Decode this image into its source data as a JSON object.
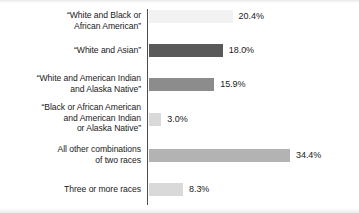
{
  "chart_data": {
    "type": "bar",
    "orientation": "horizontal",
    "title": "",
    "subtitle": "",
    "xlabel": "",
    "ylabel": "",
    "grid": false,
    "legend": null,
    "axis": {
      "value_axis_range": [
        0,
        40
      ],
      "value_axis_unit": "percent",
      "value_axis_ticks_shown": false,
      "category_axis_line": true
    },
    "categories": [
      "“White and Black or\nAfrican American”",
      "“White and Asian”",
      "“White and American Indian\nand Alaska Native”",
      "“Black or African American\nand American Indian\nor Alaska Native”",
      "All other combinations\nof two races",
      "Three or more races"
    ],
    "values": [
      20.4,
      18.0,
      15.9,
      3.0,
      34.4,
      8.3
    ],
    "value_labels": [
      "20.4%",
      "18.0%",
      "15.9%",
      "3.0%",
      "34.4%",
      "8.3%"
    ],
    "bar_colors": [
      "#f2f2f2",
      "#595959",
      "#8c8c8c",
      "#d9d9d9",
      "#b3b3b3",
      "#d9d9d9"
    ],
    "axis_color": "#4d4d4d",
    "text_color": "#1a1a1a",
    "background_color": "#ffffff"
  }
}
